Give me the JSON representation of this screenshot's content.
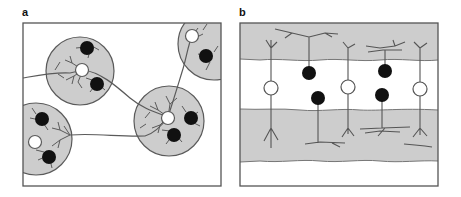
{
  "figure": {
    "panels": [
      {
        "label": "a",
        "description": "Clustered neurons: gray circular domains each containing one white and dark cells with branching dendrites, linked by long processes"
      },
      {
        "label": "b",
        "description": "Layered organization: alternating gray and white horizontal bands with white and dark cells extending dendrites into gray layers"
      }
    ],
    "legend": {
      "white_cell": "open circle",
      "dark_cell": "filled black circle",
      "domain": "gray shaded region"
    },
    "colors": {
      "domain_fill": "#cdcdcd",
      "line": "#5a5a5a",
      "dark_cell": "#111111",
      "white_cell": "#ffffff",
      "frame": "#555555"
    }
  }
}
